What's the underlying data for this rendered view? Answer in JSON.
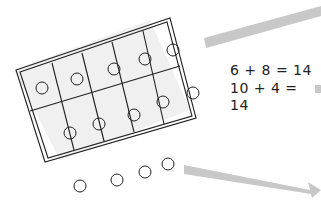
{
  "diagram": {
    "type": "ten-frame illustration",
    "ten_frame": {
      "rows": 2,
      "columns": 5,
      "counters_in_frame": 10,
      "counters_outside_frame": 4
    },
    "equations": [
      {
        "text": "6 + 8 = 14"
      },
      {
        "text": "10 + 4 = 14"
      }
    ],
    "colors": {
      "ink": "#222222",
      "frame_fill": "#ededed",
      "arrow": "#c8c8c8"
    }
  }
}
